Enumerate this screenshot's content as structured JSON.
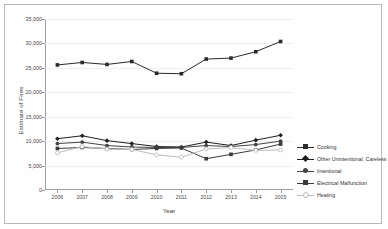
{
  "chart_data": {
    "type": "line",
    "title": "",
    "xlabel": "Year",
    "ylabel": "Estimate of Fires",
    "x": [
      2006,
      2007,
      2008,
      2009,
      2010,
      2011,
      2012,
      2013,
      2014,
      2015
    ],
    "xticklabels": [
      "2006",
      "2007",
      "2008",
      "2009",
      "2010",
      "2011",
      "2012",
      "2013",
      "2014",
      "2015"
    ],
    "yticklabels": [
      "0",
      "5,000",
      "10,000",
      "15,000",
      "20,000",
      "25,000",
      "30,000",
      "35,000"
    ],
    "yticks": [
      0,
      5000,
      10000,
      15000,
      20000,
      25000,
      30000,
      35000
    ],
    "ylim": [
      0,
      35000
    ],
    "grid": true,
    "legend_position": "right",
    "series": [
      {
        "name": "Cooking",
        "color": "#2b2b2b",
        "marker": "square",
        "values": [
          25600,
          26100,
          25700,
          26300,
          23900,
          23800,
          26800,
          27000,
          28300,
          30400
        ]
      },
      {
        "name": "Other Unintentional, Careless",
        "color": "#1f1f1f",
        "marker": "diamond",
        "values": [
          10500,
          11100,
          10100,
          9500,
          8900,
          8800,
          9800,
          9100,
          10200,
          11200
        ]
      },
      {
        "name": "Intentional",
        "color": "#444444",
        "marker": "circle",
        "values": [
          9500,
          9800,
          9100,
          8800,
          8700,
          8700,
          9100,
          8900,
          9300,
          10000
        ]
      },
      {
        "name": "Electrical Malfunction",
        "color": "#3a3a3a",
        "marker": "square",
        "values": [
          8500,
          8700,
          8500,
          8300,
          8500,
          8600,
          6400,
          7300,
          8200,
          9400
        ]
      },
      {
        "name": "Heating",
        "color": "#bdbdbd",
        "marker": "open-circle",
        "values": [
          7600,
          8900,
          8400,
          8300,
          7200,
          6700,
          8400,
          8700,
          8100,
          8200
        ]
      }
    ]
  },
  "legend": {
    "items": [
      "Cooking",
      "Other Unintentional, Careless",
      "Intentional",
      "Electrical Malfunction",
      "Heating"
    ]
  }
}
